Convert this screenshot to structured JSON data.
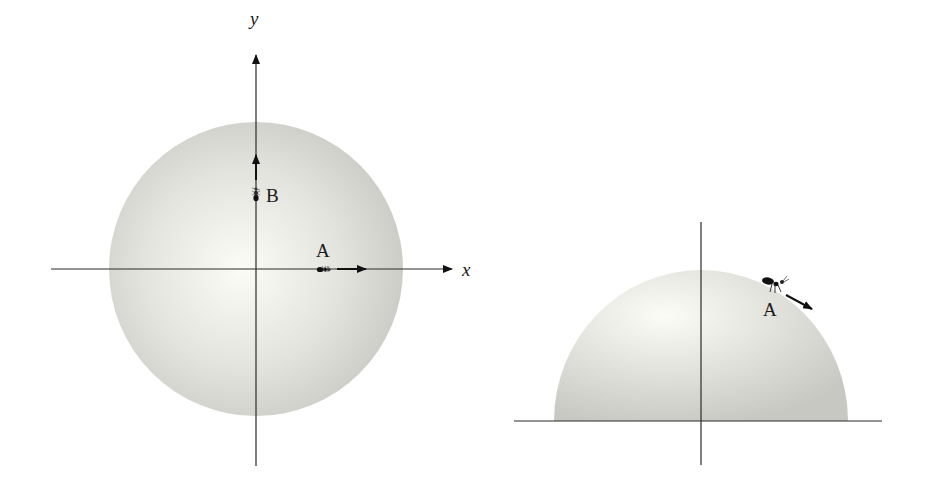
{
  "figure": {
    "colors": {
      "background": "#ffffff",
      "sphere_highlight": "#fbfbf5",
      "sphere_shadow": "#c9c9c4",
      "line": "#2b2b2b",
      "ink": "#111111"
    }
  },
  "top_view": {
    "x_axis_label": "x",
    "y_axis_label": "y",
    "points": [
      {
        "label": "A",
        "position": "on positive x-axis",
        "arrow": "pointing +x"
      },
      {
        "label": "B",
        "position": "on positive y-axis",
        "arrow": "pointing +y"
      }
    ]
  },
  "side_view": {
    "points": [
      {
        "label": "A",
        "position": "upper right of hemisphere",
        "arrow": "pointing down-right along surface"
      }
    ]
  }
}
